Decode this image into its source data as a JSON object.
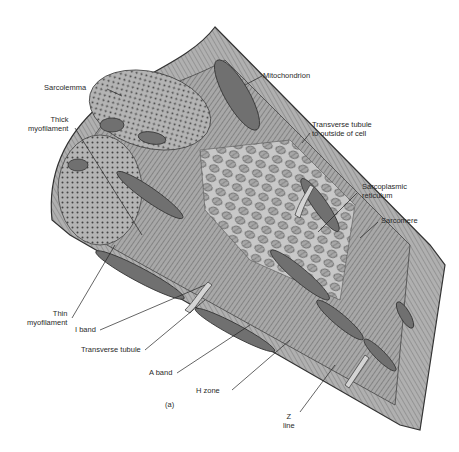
{
  "figure": {
    "caption": "(a)"
  },
  "labels": {
    "sarcolemma": "Sarcolemma",
    "thick_myofilament": [
      "Thick",
      "myofilament"
    ],
    "mitochondrion": "Mitochondrion",
    "transverse_tubule_outside": [
      "Transverse tubule",
      "to outside of cell"
    ],
    "sarcoplasmic_reticulum": [
      "Sarcoplasmic",
      "reticulum"
    ],
    "sarcomere": "Sarcomere",
    "thin_myofilament": [
      "Thin",
      "myofilament"
    ],
    "i_band": "I band",
    "transverse_tubule": "Transverse tubule",
    "a_band": "A band",
    "h_zone": "H zone",
    "z_line": [
      "Z",
      "line"
    ]
  },
  "colors": {
    "background": "#ffffff",
    "tissue_light": "#b9b9b9",
    "tissue_mid": "#9a9a9a",
    "tissue_dark": "#5a5a5a",
    "outline": "#333333",
    "leader_line": "#222222",
    "text": "#2a2a2a"
  }
}
